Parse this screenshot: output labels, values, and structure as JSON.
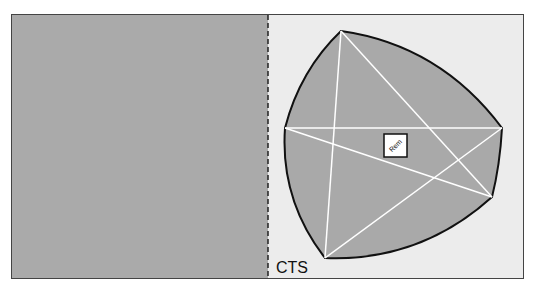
{
  "diagram": {
    "label": "CTS",
    "center_box_label": "Rem",
    "colors": {
      "left_panel": "#aaaaaa",
      "right_panel": "#ececec",
      "shape_fill": "#a9a9a9",
      "shape_stroke": "#111111",
      "inner_lines": "#ffffff"
    },
    "vertices": {
      "top": [
        341,
        31
      ],
      "left": [
        285,
        128
      ],
      "right": [
        502,
        128
      ],
      "lower_right": [
        492,
        197
      ],
      "bottom": [
        325,
        258
      ]
    }
  }
}
